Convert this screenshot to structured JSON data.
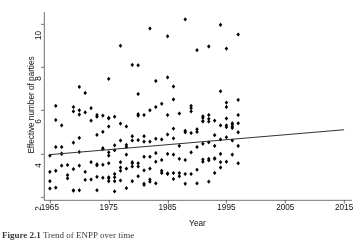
{
  "figure": {
    "caption_label": "Figure 2.1",
    "caption_text": "Trend of ENPP over time"
  },
  "chart_data": {
    "type": "scatter",
    "title": "",
    "xlabel": "Year",
    "ylabel": "Effective number of parties",
    "xlim": [
      1964,
      2016
    ],
    "ylim": [
      1.85,
      10.45
    ],
    "xticks": [
      1965,
      1975,
      1985,
      1995,
      2005,
      2015
    ],
    "yticks": [
      2,
      4,
      6,
      8,
      10
    ],
    "xtick_labels": [
      "1965",
      "1975",
      "1985",
      "1995",
      "2005",
      "2015"
    ],
    "ytick_labels": [
      "2",
      "4",
      "6",
      "8",
      "10"
    ],
    "grid": false,
    "legend": null,
    "marker": {
      "shape": "diamond",
      "color": "#000000",
      "size": 3.1
    },
    "series": [
      {
        "name": "Effective number of parties",
        "points": [
          [
            1965,
            3.9
          ],
          [
            1965,
            3.15
          ],
          [
            1965,
            2.72
          ],
          [
            1965,
            2.38
          ],
          [
            1966,
            5.55
          ],
          [
            1966,
            6.2
          ],
          [
            1966,
            4.3
          ],
          [
            1966,
            3.2
          ],
          [
            1966,
            2.42
          ],
          [
            1967,
            5.3
          ],
          [
            1967,
            4.3
          ],
          [
            1967,
            4.0
          ],
          [
            1967,
            3.98
          ],
          [
            1967,
            3.44
          ],
          [
            1968,
            3.47
          ],
          [
            1968,
            3.0
          ],
          [
            1968,
            2.85
          ],
          [
            1969,
            6.15
          ],
          [
            1969,
            5.95
          ],
          [
            1969,
            4.5
          ],
          [
            1969,
            3.28
          ],
          [
            1969,
            2.3
          ],
          [
            1969,
            2.28
          ],
          [
            1970,
            7.08
          ],
          [
            1970,
            6.0
          ],
          [
            1970,
            5.8
          ],
          [
            1970,
            4.72
          ],
          [
            1970,
            4.07
          ],
          [
            1970,
            3.44
          ],
          [
            1970,
            2.3
          ],
          [
            1971,
            6.8
          ],
          [
            1971,
            5.9
          ],
          [
            1971,
            3.15
          ],
          [
            1971,
            2.78
          ],
          [
            1972,
            6.1
          ],
          [
            1972,
            5.52
          ],
          [
            1972,
            3.6
          ],
          [
            1972,
            2.8
          ],
          [
            1973,
            5.7
          ],
          [
            1973,
            5.78
          ],
          [
            1973,
            4.86
          ],
          [
            1973,
            3.5
          ],
          [
            1973,
            3.45
          ],
          [
            1973,
            2.92
          ],
          [
            1973,
            2.3
          ],
          [
            1974,
            5.75
          ],
          [
            1974,
            5.0
          ],
          [
            1974,
            4.25
          ],
          [
            1974,
            4.2
          ],
          [
            1974,
            3.48
          ],
          [
            1974,
            2.88
          ],
          [
            1975,
            7.45
          ],
          [
            1975,
            5.65
          ],
          [
            1975,
            5.62
          ],
          [
            1975,
            5.25
          ],
          [
            1975,
            4.05
          ],
          [
            1975,
            3.9
          ],
          [
            1975,
            3.55
          ],
          [
            1975,
            2.85
          ],
          [
            1975,
            2.9
          ],
          [
            1975,
            2.72
          ],
          [
            1976,
            5.7
          ],
          [
            1976,
            4.38
          ],
          [
            1976,
            4.15
          ],
          [
            1976,
            3.05
          ],
          [
            1976,
            2.9
          ],
          [
            1976,
            2.72
          ],
          [
            1976,
            2.25
          ],
          [
            1977,
            8.98
          ],
          [
            1977,
            5.38
          ],
          [
            1977,
            4.6
          ],
          [
            1977,
            3.6
          ],
          [
            1977,
            3.2
          ],
          [
            1977,
            3.35
          ],
          [
            1977,
            2.75
          ],
          [
            1978,
            5.25
          ],
          [
            1978,
            4.4
          ],
          [
            1978,
            4.3
          ],
          [
            1978,
            3.95
          ],
          [
            1978,
            3.3
          ],
          [
            1978,
            2.4
          ],
          [
            1979,
            8.1
          ],
          [
            1979,
            4.8
          ],
          [
            1979,
            4.6
          ],
          [
            1979,
            3.55
          ],
          [
            1979,
            3.6
          ],
          [
            1979,
            3.4
          ],
          [
            1979,
            2.72
          ],
          [
            1980,
            8.08
          ],
          [
            1980,
            6.75
          ],
          [
            1980,
            5.82
          ],
          [
            1980,
            5.75
          ],
          [
            1980,
            4.62
          ],
          [
            1980,
            3.55
          ],
          [
            1980,
            3.4
          ],
          [
            1980,
            2.95
          ],
          [
            1981,
            5.78
          ],
          [
            1981,
            4.8
          ],
          [
            1981,
            4.55
          ],
          [
            1981,
            3.85
          ],
          [
            1981,
            3.22
          ],
          [
            1981,
            2.6
          ],
          [
            1981,
            2.55
          ],
          [
            1982,
            9.78
          ],
          [
            1982,
            6.0
          ],
          [
            1982,
            4.55
          ],
          [
            1982,
            3.85
          ],
          [
            1982,
            3.3
          ],
          [
            1982,
            2.8
          ],
          [
            1982,
            2.7
          ],
          [
            1983,
            7.35
          ],
          [
            1983,
            6.15
          ],
          [
            1983,
            4.68
          ],
          [
            1983,
            4.02
          ],
          [
            1983,
            3.62
          ],
          [
            1983,
            2.62
          ],
          [
            1984,
            6.3
          ],
          [
            1984,
            4.65
          ],
          [
            1984,
            3.7
          ],
          [
            1984,
            3.2
          ],
          [
            1984,
            3.1
          ],
          [
            1985,
            9.42
          ],
          [
            1985,
            7.52
          ],
          [
            1985,
            5.78
          ],
          [
            1985,
            4.88
          ],
          [
            1985,
            3.98
          ],
          [
            1985,
            3.05
          ],
          [
            1985,
            3.08
          ],
          [
            1986,
            7.1
          ],
          [
            1986,
            6.5
          ],
          [
            1986,
            5.15
          ],
          [
            1986,
            4.7
          ],
          [
            1986,
            3.95
          ],
          [
            1986,
            3.1
          ],
          [
            1986,
            2.82
          ],
          [
            1987,
            5.85
          ],
          [
            1987,
            4.35
          ],
          [
            1987,
            3.75
          ],
          [
            1987,
            3.1
          ],
          [
            1987,
            2.95
          ],
          [
            1988,
            10.2
          ],
          [
            1988,
            5.05
          ],
          [
            1988,
            4.98
          ],
          [
            1988,
            3.7
          ],
          [
            1988,
            3.05
          ],
          [
            1988,
            2.6
          ],
          [
            1989,
            6.2
          ],
          [
            1989,
            6.1
          ],
          [
            1989,
            5.95
          ],
          [
            1989,
            4.95
          ],
          [
            1989,
            4.05
          ],
          [
            1989,
            3.05
          ],
          [
            1990,
            8.78
          ],
          [
            1990,
            5.12
          ],
          [
            1990,
            5.0
          ],
          [
            1990,
            4.3
          ],
          [
            1990,
            3.25
          ],
          [
            1990,
            2.62
          ],
          [
            1991,
            5.72
          ],
          [
            1991,
            5.65
          ],
          [
            1991,
            5.5
          ],
          [
            1991,
            5.48
          ],
          [
            1991,
            4.45
          ],
          [
            1991,
            3.72
          ],
          [
            1991,
            3.62
          ],
          [
            1992,
            8.95
          ],
          [
            1992,
            5.78
          ],
          [
            1992,
            5.6
          ],
          [
            1992,
            5.48
          ],
          [
            1992,
            4.52
          ],
          [
            1992,
            3.75
          ],
          [
            1992,
            3.68
          ],
          [
            1992,
            2.7
          ],
          [
            1993,
            5.52
          ],
          [
            1993,
            4.85
          ],
          [
            1993,
            4.35
          ],
          [
            1993,
            3.78
          ],
          [
            1993,
            3.75
          ],
          [
            1993,
            3.1
          ],
          [
            1994,
            9.95
          ],
          [
            1994,
            6.88
          ],
          [
            1994,
            5.3
          ],
          [
            1994,
            4.65
          ],
          [
            1994,
            3.98
          ],
          [
            1994,
            3.6
          ],
          [
            1994,
            3.35
          ],
          [
            1995,
            8.85
          ],
          [
            1995,
            6.35
          ],
          [
            1995,
            6.15
          ],
          [
            1995,
            5.62
          ],
          [
            1995,
            5.3
          ],
          [
            1995,
            5.22
          ],
          [
            1995,
            4.75
          ],
          [
            1995,
            3.62
          ],
          [
            1996,
            5.4
          ],
          [
            1996,
            5.35
          ],
          [
            1996,
            5.25
          ],
          [
            1996,
            5.18
          ],
          [
            1996,
            4.6
          ],
          [
            1996,
            3.95
          ],
          [
            1997,
            9.5
          ],
          [
            1997,
            6.48
          ],
          [
            1997,
            5.78
          ],
          [
            1997,
            5.4
          ],
          [
            1997,
            4.98
          ],
          [
            1997,
            4.35
          ],
          [
            1997,
            3.55
          ]
        ]
      }
    ],
    "fit_line": {
      "name": "linear fit",
      "x": [
        1965,
        2015
      ],
      "y": [
        3.95,
        5.1
      ],
      "color": "#333333",
      "width": 1
    }
  }
}
